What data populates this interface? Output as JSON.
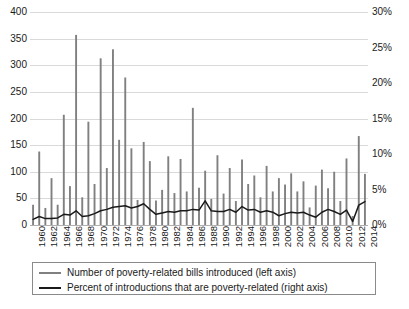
{
  "chart_data": {
    "type": "bar",
    "title": "",
    "xlabel": "",
    "ylabel": "",
    "y2label": "",
    "grid": true,
    "legend_position": "bottom",
    "x": [
      1960,
      1961,
      1962,
      1963,
      1964,
      1965,
      1966,
      1967,
      1968,
      1969,
      1970,
      1971,
      1972,
      1973,
      1974,
      1975,
      1976,
      1977,
      1978,
      1979,
      1980,
      1981,
      1982,
      1983,
      1984,
      1985,
      1986,
      1987,
      1988,
      1989,
      1990,
      1991,
      1992,
      1993,
      1994,
      1995,
      1996,
      1997,
      1998,
      1999,
      2000,
      2001,
      2002,
      2003,
      2004,
      2005,
      2006,
      2007,
      2008,
      2009,
      2010,
      2011,
      2012,
      2013,
      2014
    ],
    "axes": {
      "left": {
        "label": "Number of poverty-related bills introduced",
        "ticks": [
          0,
          50,
          100,
          150,
          200,
          250,
          300,
          350,
          400
        ],
        "tick_labels": [
          "0",
          "50",
          "100",
          "150",
          "200",
          "250",
          "300",
          "350",
          "400"
        ],
        "lim": [
          0,
          400
        ]
      },
      "right": {
        "label": "Percent of introductions that are poverty-related",
        "ticks": [
          0,
          5,
          10,
          15,
          20,
          25,
          30
        ],
        "tick_labels": [
          "0%",
          "5%",
          "10%",
          "15%",
          "20%",
          "25%",
          "30%"
        ],
        "lim": [
          0,
          30
        ]
      },
      "x": {
        "tick_labels": [
          "1960",
          "1962",
          "1964",
          "1966",
          "1968",
          "1970",
          "1972",
          "1974",
          "1976",
          "1978",
          "1980",
          "1982",
          "1984",
          "1986",
          "1988",
          "1990",
          "1992",
          "1994",
          "1996",
          "1998",
          "2000",
          "2002",
          "2004",
          "2006",
          "2008",
          "2010",
          "2012",
          "2014"
        ],
        "tick_step_years": 2,
        "lim": [
          1960,
          2014
        ]
      }
    },
    "series": [
      {
        "name": "Number of poverty-related bills introduced (left axis)",
        "axis": "left",
        "type": "bar",
        "color": "#808080",
        "values": [
          38,
          138,
          32,
          88,
          38,
          207,
          73,
          357,
          52,
          194,
          77,
          313,
          107,
          330,
          160,
          277,
          144,
          47,
          156,
          120,
          46,
          66,
          129,
          60,
          124,
          63,
          220,
          70,
          102,
          49,
          131,
          59,
          107,
          45,
          123,
          77,
          93,
          52,
          111,
          63,
          88,
          76,
          97,
          63,
          82,
          33,
          74,
          104,
          69,
          100,
          45,
          125,
          17,
          167,
          96
        ]
      },
      {
        "name": "Percent of introductions that are poverty-related (right axis)",
        "axis": "right",
        "type": "line",
        "color": "#1a1a1a",
        "values": [
          0.8,
          1.2,
          0.9,
          0.9,
          1.0,
          1.5,
          1.4,
          2.0,
          1.2,
          1.3,
          1.6,
          2.0,
          2.2,
          2.5,
          2.6,
          2.7,
          2.4,
          2.6,
          3.0,
          2.2,
          1.5,
          1.7,
          1.9,
          1.8,
          2.0,
          2.0,
          2.2,
          2.1,
          3.4,
          2.0,
          1.9,
          1.9,
          2.2,
          1.8,
          2.6,
          2.1,
          2.2,
          1.8,
          2.0,
          1.8,
          1.3,
          1.6,
          1.8,
          1.7,
          1.8,
          1.4,
          1.1,
          1.8,
          2.2,
          1.9,
          1.5,
          2.1,
          0.5,
          2.8,
          3.3
        ]
      }
    ]
  },
  "legend": {
    "items": [
      {
        "label": "Number of poverty-related bills introduced (left axis)",
        "color": "#808080"
      },
      {
        "label": "Percent of introductions that are poverty-related (right axis)",
        "color": "#1a1a1a"
      }
    ]
  },
  "bottom_caption": {
    "text": ""
  }
}
